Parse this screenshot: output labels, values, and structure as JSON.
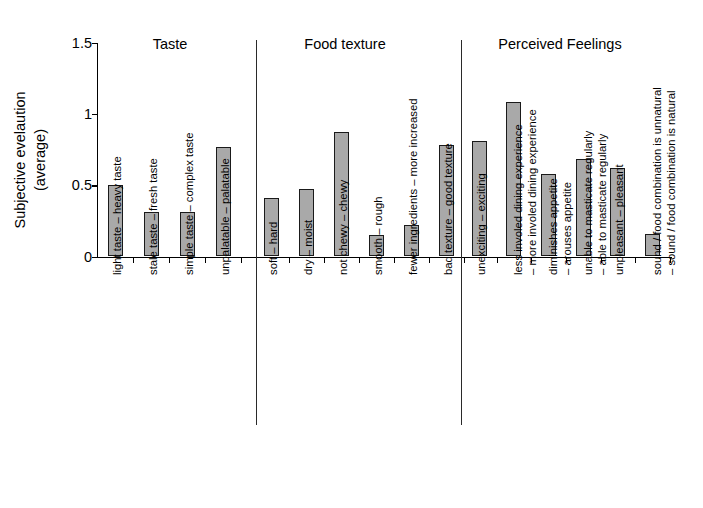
{
  "chart_data": {
    "type": "bar",
    "title": "",
    "xlabel": "",
    "ylabel": "Subjective evelaution (average)",
    "ylabel_line1": "Subjective evelaution",
    "ylabel_line2": "(average)",
    "ylim": [
      0,
      1.5
    ],
    "yticks": [
      "0",
      "0.5",
      "1",
      "1.5"
    ],
    "ytick_values": [
      0,
      0.5,
      1,
      1.5
    ],
    "grid": false,
    "legend": "none",
    "bar_color": "#a9a9a9",
    "bar_edge_color": "#1a1a1a",
    "groups": [
      {
        "name": "Taste",
        "categories": [
          "light taste – heavy taste",
          "stale taste – fresh taste",
          "simple taste – complex taste",
          "unpalatable – palatable"
        ],
        "values": [
          0.5,
          0.31,
          0.31,
          0.77
        ]
      },
      {
        "name": "Food texture",
        "categories": [
          "soft – hard",
          "dry – moist",
          "not chewy – chewy",
          "smooth – rough",
          "fewer ingredients – more increased",
          "bad texture – good texture"
        ],
        "values": [
          0.41,
          0.47,
          0.87,
          0.15,
          0.22,
          0.78
        ]
      },
      {
        "name": "Perceived Feelings",
        "categories": [
          "unexciting – exciting",
          "less involed dining experience – more involed dining experience",
          "diminishes appetite – arouses appetite",
          "unable to masticate regularly – able to masticate regularly",
          "unpleasant – pleasant",
          "sound / food combination is unnatural – sound / food combination is natural"
        ],
        "values": [
          0.81,
          1.08,
          0.58,
          0.68,
          0.62,
          0.16
        ]
      }
    ],
    "categories_flat": [
      "light taste – heavy taste",
      "stale taste – fresh taste",
      "simple taste – complex taste",
      "unpalatable – palatable",
      "soft – hard",
      "dry – moist",
      "not chewy – chewy",
      "smooth – rough",
      "fewer ingredients – more increased",
      "bad texture – good texture",
      "unexciting – exciting",
      "less involed dining experience – more involed dining experience",
      "diminishes appetite – arouses appetite",
      "unable to masticate regularly – able to masticate regularly",
      "unpleasant – pleasant",
      "sound / food combination is unnatural – sound / food combination is natural"
    ],
    "values_flat": [
      0.5,
      0.31,
      0.31,
      0.77,
      0.41,
      0.47,
      0.87,
      0.15,
      0.22,
      0.78,
      0.81,
      1.08,
      0.58,
      0.68,
      0.62,
      0.16
    ],
    "category_label_lines": [
      [
        "light taste – heavy taste"
      ],
      [
        "stale taste – fresh taste"
      ],
      [
        "simple taste – complex taste"
      ],
      [
        "unpalatable – palatable"
      ],
      [
        "soft – hard"
      ],
      [
        "dry – moist"
      ],
      [
        "not chewy – chewy"
      ],
      [
        "smooth – rough"
      ],
      [
        "fewer ingredients – more increased"
      ],
      [
        "bad texture – good texture"
      ],
      [
        "unexciting – exciting"
      ],
      [
        "less involed dining experience",
        "– more involed dining experience"
      ],
      [
        "diminishes appetite",
        "– arouses appetite"
      ],
      [
        "unable to masticate regularly",
        "– able to masticate regularly"
      ],
      [
        "unpleasant – pleasant"
      ],
      [
        "sound / food combination is unnatural",
        "– sound / food combination is natural"
      ]
    ]
  }
}
